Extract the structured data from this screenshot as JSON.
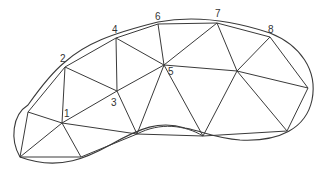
{
  "diagram": {
    "type": "triangulation-mesh",
    "vertices": {
      "v1": {
        "label": "1",
        "x": 62,
        "y": 123
      },
      "v2": {
        "label": "2",
        "x": 65,
        "y": 67
      },
      "v3": {
        "label": "3",
        "x": 117,
        "y": 91
      },
      "v4": {
        "label": "4",
        "x": 116,
        "y": 38
      },
      "v5": {
        "label": "5",
        "x": 164,
        "y": 65
      },
      "v6": {
        "label": "6",
        "x": 158,
        "y": 24
      },
      "v7": {
        "label": "7",
        "x": 217,
        "y": 23
      },
      "v8": {
        "label": "8",
        "x": 270,
        "y": 37
      },
      "L": {
        "label": "",
        "x": 28,
        "y": 112
      },
      "BL": {
        "label": "",
        "x": 20,
        "y": 157
      },
      "B": {
        "label": "",
        "x": 81,
        "y": 157
      },
      "M": {
        "label": "",
        "x": 137,
        "y": 134
      },
      "BM": {
        "label": "",
        "x": 203,
        "y": 136
      },
      "P": {
        "label": "",
        "x": 237,
        "y": 71
      },
      "R": {
        "label": "",
        "x": 308,
        "y": 88
      },
      "BR": {
        "label": "",
        "x": 287,
        "y": 131
      }
    },
    "labels": [
      {
        "text": "1",
        "x": 64,
        "y": 117
      },
      {
        "text": "2",
        "x": 60,
        "y": 62
      },
      {
        "text": "3",
        "x": 111,
        "y": 106
      },
      {
        "text": "4",
        "x": 112,
        "y": 33
      },
      {
        "text": "5",
        "x": 168,
        "y": 75
      },
      {
        "text": "6",
        "x": 155,
        "y": 20
      },
      {
        "text": "7",
        "x": 215,
        "y": 17
      },
      {
        "text": "8",
        "x": 270,
        "y": 33
      }
    ],
    "stroke_color": "#3a3a3a",
    "background": "#ffffff"
  }
}
